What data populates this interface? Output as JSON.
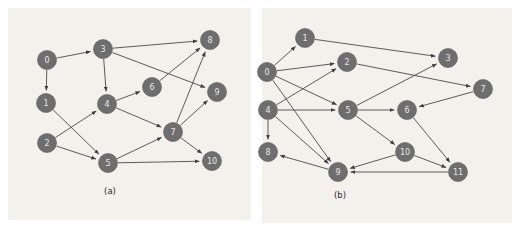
{
  "figure": {
    "background_color": "#ffffff",
    "panel_background_color": "#f2f1ec",
    "node_fill_color": "#6e6e6e",
    "node_label_color": "#e8e8e8",
    "edge_color": "#4a4a4a"
  },
  "panels": [
    {
      "id": "a",
      "caption": "(a)",
      "node_count": 11,
      "edge_count": 16,
      "nodes": [
        {
          "label": "0",
          "x": 47,
          "y": 60,
          "r": 9.5
        },
        {
          "label": "1",
          "x": 46,
          "y": 103,
          "r": 9.5
        },
        {
          "label": "2",
          "x": 47,
          "y": 143,
          "r": 9.5
        },
        {
          "label": "3",
          "x": 103,
          "y": 49,
          "r": 9.5
        },
        {
          "label": "4",
          "x": 107,
          "y": 104,
          "r": 9.5
        },
        {
          "label": "5",
          "x": 108,
          "y": 163,
          "r": 9.5
        },
        {
          "label": "6",
          "x": 152,
          "y": 87,
          "r": 9.5
        },
        {
          "label": "7",
          "x": 173,
          "y": 132,
          "r": 9.5
        },
        {
          "label": "8",
          "x": 210,
          "y": 40,
          "r": 9.5
        },
        {
          "label": "9",
          "x": 217,
          "y": 92,
          "r": 9.5
        },
        {
          "label": "10",
          "x": 212,
          "y": 161,
          "r": 9.5
        }
      ],
      "edges": [
        {
          "from": "0",
          "to": "3"
        },
        {
          "from": "0",
          "to": "1"
        },
        {
          "from": "1",
          "to": "5"
        },
        {
          "from": "2",
          "to": "4"
        },
        {
          "from": "2",
          "to": "5"
        },
        {
          "from": "3",
          "to": "4"
        },
        {
          "from": "3",
          "to": "8"
        },
        {
          "from": "3",
          "to": "9"
        },
        {
          "from": "4",
          "to": "6"
        },
        {
          "from": "4",
          "to": "7"
        },
        {
          "from": "5",
          "to": "7"
        },
        {
          "from": "5",
          "to": "10"
        },
        {
          "from": "6",
          "to": "8"
        },
        {
          "from": "7",
          "to": "8"
        },
        {
          "from": "7",
          "to": "9"
        },
        {
          "from": "7",
          "to": "10"
        }
      ]
    },
    {
      "id": "b",
      "caption": "(b)",
      "node_count": 12,
      "edge_count": 17,
      "nodes": [
        {
          "label": "0",
          "x": 267,
          "y": 72,
          "r": 9.5
        },
        {
          "label": "1",
          "x": 305,
          "y": 38,
          "r": 9.5
        },
        {
          "label": "2",
          "x": 347,
          "y": 62,
          "r": 9.5
        },
        {
          "label": "3",
          "x": 448,
          "y": 58,
          "r": 9.5
        },
        {
          "label": "4",
          "x": 268,
          "y": 110,
          "r": 9.5
        },
        {
          "label": "5",
          "x": 348,
          "y": 110,
          "r": 9.5
        },
        {
          "label": "6",
          "x": 407,
          "y": 110,
          "r": 9.5
        },
        {
          "label": "7",
          "x": 483,
          "y": 89,
          "r": 9.5
        },
        {
          "label": "8",
          "x": 268,
          "y": 152,
          "r": 9.5
        },
        {
          "label": "9",
          "x": 338,
          "y": 172,
          "r": 9.5
        },
        {
          "label": "10",
          "x": 405,
          "y": 152,
          "r": 9.5
        },
        {
          "label": "11",
          "x": 458,
          "y": 172,
          "r": 9.5
        }
      ],
      "edges": [
        {
          "from": "0",
          "to": "1"
        },
        {
          "from": "0",
          "to": "2"
        },
        {
          "from": "0",
          "to": "5"
        },
        {
          "from": "0",
          "to": "9"
        },
        {
          "from": "1",
          "to": "3"
        },
        {
          "from": "2",
          "to": "7"
        },
        {
          "from": "4",
          "to": "2"
        },
        {
          "from": "4",
          "to": "5"
        },
        {
          "from": "4",
          "to": "8"
        },
        {
          "from": "4",
          "to": "9"
        },
        {
          "from": "5",
          "to": "3"
        },
        {
          "from": "5",
          "to": "6"
        },
        {
          "from": "5",
          "to": "10"
        },
        {
          "from": "6",
          "to": "11"
        },
        {
          "from": "7",
          "to": "6"
        },
        {
          "from": "10",
          "to": "9"
        },
        {
          "from": "10",
          "to": "11"
        },
        {
          "from": "11",
          "to": "9"
        },
        {
          "from": "9",
          "to": "8"
        }
      ]
    }
  ]
}
